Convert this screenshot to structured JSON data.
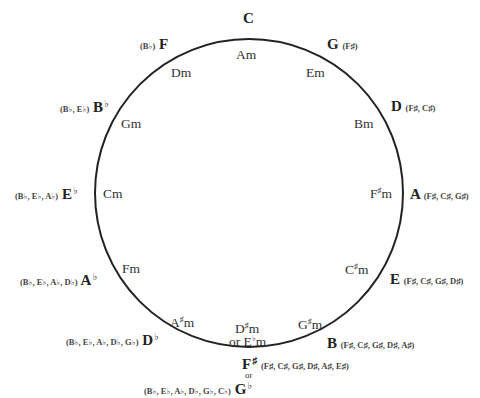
{
  "circle": {
    "cx": 249,
    "cy": 193,
    "r": 154,
    "stroke": "#222222",
    "stroke_width": 2
  },
  "symbols": {
    "sharp": "♯",
    "flat": "♭"
  },
  "keys": [
    {
      "major": "C",
      "accidentals": "",
      "minor": "Am"
    },
    {
      "major": "G",
      "accidentals": "(F♯)",
      "minor": "Em"
    },
    {
      "major": "D",
      "accidentals": "(F♯, C♯)",
      "minor": "Bm"
    },
    {
      "major": "A",
      "accidentals": "(F♯, C♯, G♯)",
      "minor": "F",
      "minor_mod": "♯",
      "minor_suffix": "m"
    },
    {
      "major": "E",
      "accidentals": "(F♯, C♯, G♯, D♯)",
      "minor": "C",
      "minor_mod": "♯",
      "minor_suffix": "m"
    },
    {
      "major": "B",
      "accidentals": "(F♯, C♯, G♯, D♯, A♯)",
      "minor": "G",
      "minor_mod": "♯",
      "minor_suffix": "m"
    },
    {
      "major": "F",
      "major_mod": "♯",
      "accidentals": "(F♯, C♯, G♯, D♯, A♯, E♯)",
      "or_label": "or",
      "alt_major": "G",
      "alt_major_mod": "♭",
      "alt_accidentals": "(B♭, E♭, A♭, D♭, G♭, C♭)",
      "minor": "D",
      "minor_mod": "♯",
      "minor_suffix": "m",
      "minor_or": "or E",
      "minor_or_mod": "♭",
      "minor_or_suffix": "m"
    },
    {
      "major": "D",
      "major_mod": "♭",
      "accidentals": "(B♭, E♭, A♭, D♭, G♭)",
      "minor": "A",
      "minor_mod": "♯",
      "minor_suffix": "m"
    },
    {
      "major": "A",
      "major_mod": "♭",
      "accidentals": "(B♭, E♭, A♭, D♭)",
      "minor": "Fm"
    },
    {
      "major": "E",
      "major_mod": "♭",
      "accidentals": "(B♭, E♭, A♭)",
      "minor": "Cm"
    },
    {
      "major": "B",
      "major_mod": "♭",
      "accidentals": "(B♭, E♭)",
      "minor": "Gm"
    },
    {
      "major": "F",
      "accidentals": "(B♭)",
      "minor": "Dm"
    }
  ]
}
